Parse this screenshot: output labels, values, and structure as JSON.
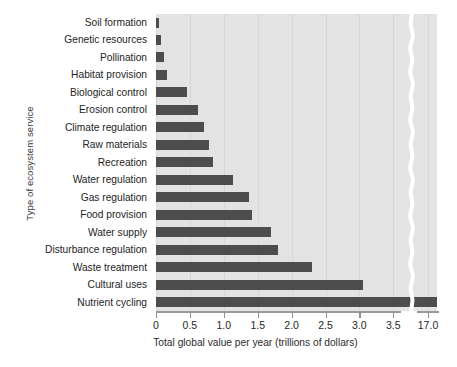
{
  "chart_data": {
    "type": "bar",
    "orientation": "horizontal",
    "title": "",
    "xlabel": "Total global value per year (trillions of dollars)",
    "ylabel": "Type of ecosystem service",
    "categories": [
      "Soil formation",
      "Genetic resources",
      "Pollination",
      "Habitat provision",
      "Biological control",
      "Erosion control",
      "Climate regulation",
      "Raw materials",
      "Recreation",
      "Water regulation",
      "Gas regulation",
      "Food provision",
      "Water supply",
      "Disturbance regulation",
      "Waste treatment",
      "Cultural uses",
      "Nutrient cycling"
    ],
    "values": [
      0.05,
      0.08,
      0.12,
      0.16,
      0.45,
      0.62,
      0.71,
      0.78,
      0.84,
      1.13,
      1.37,
      1.41,
      1.7,
      1.8,
      2.3,
      3.05,
      17.0
    ],
    "xticks": [
      "0",
      "0.5",
      "1.0",
      "1.5",
      "2.0",
      "2.5",
      "3.0",
      "3.5",
      "17.0"
    ],
    "xtick_values": [
      0,
      0.5,
      1.0,
      1.5,
      2.0,
      2.5,
      3.0,
      3.5,
      17.0
    ],
    "xlim": [
      0,
      3.7
    ],
    "axis_break": true,
    "axis_break_note": "x-axis is broken between 3.5 and 17.0",
    "grid": "vertical",
    "legend": "none",
    "bar_color": "#4d4d4d",
    "plot_background": "#e3e3e3"
  }
}
